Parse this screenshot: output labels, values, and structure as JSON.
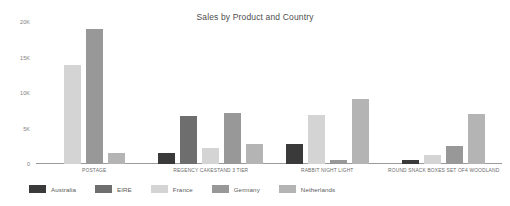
{
  "chart_data": {
    "type": "bar",
    "title": "Sales by Product and Country",
    "xlabel": "",
    "ylabel": "",
    "ylim": [
      0,
      20000
    ],
    "yticks": [
      0,
      5000,
      10000,
      15000,
      20000
    ],
    "ytick_labels": [
      "0",
      "5K",
      "10K",
      "15K",
      "20K"
    ],
    "grid": false,
    "legend_position": "bottom-left",
    "categories": [
      "POSTAGE",
      "REGENCY CAKESTAND 3 TIER",
      "RABBIT NIGHT LIGHT",
      "ROUND SNACK BOXES SET OF4 WOODLAND"
    ],
    "series": [
      {
        "name": "Australia",
        "color": "#3a3a3a",
        "values": [
          0,
          1600,
          2800,
          600
        ]
      },
      {
        "name": "EIRE",
        "color": "#6e6e6e",
        "values": [
          0,
          6800,
          0,
          0
        ]
      },
      {
        "name": "France",
        "color": "#d4d4d4",
        "values": [
          14000,
          2200,
          6900,
          1300
        ]
      },
      {
        "name": "Germany",
        "color": "#989898",
        "values": [
          19000,
          7200,
          500,
          2600
        ]
      },
      {
        "name": "Netherlands",
        "color": "#b4b4b4",
        "values": [
          1500,
          2800,
          9200,
          7000
        ]
      }
    ]
  },
  "title": "Sales by Product and Country",
  "legend": {
    "items": [
      {
        "label": "Australia",
        "color": "#3a3a3a"
      },
      {
        "label": "EIRE",
        "color": "#6e6e6e"
      },
      {
        "label": "France",
        "color": "#d4d4d4"
      },
      {
        "label": "Germany",
        "color": "#989898"
      },
      {
        "label": "Netherlands",
        "color": "#b4b4b4"
      }
    ]
  }
}
